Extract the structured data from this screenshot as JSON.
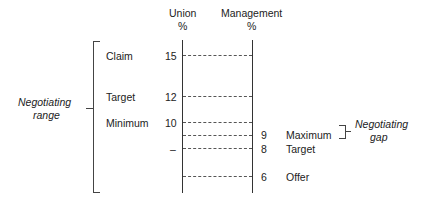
{
  "headers": {
    "union": "Union",
    "union_unit": "%",
    "management": "Management",
    "management_unit": "%"
  },
  "union_points": [
    {
      "label": "Claim",
      "value": "15"
    },
    {
      "label": "Target",
      "value": "12"
    },
    {
      "label": "Minimum",
      "value": "10"
    },
    {
      "label": "",
      "value": "–"
    }
  ],
  "management_points": [
    {
      "value": "9",
      "label": "Maximum"
    },
    {
      "value": "8",
      "label": "Target"
    },
    {
      "value": "6",
      "label": "Offer"
    }
  ],
  "brackets": {
    "range_line1": "Negotiating",
    "range_line2": "range",
    "gap_line1": "Negotiating",
    "gap_line2": "gap"
  }
}
